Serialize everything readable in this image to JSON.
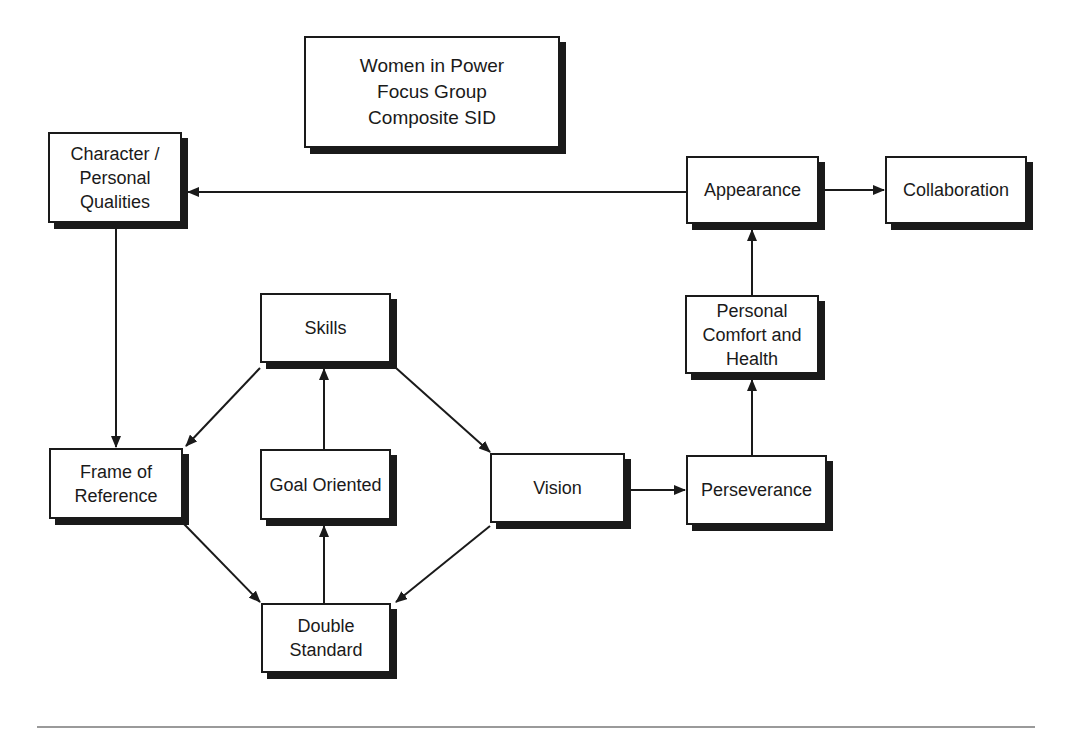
{
  "title": {
    "text": "Women in Power\nFocus Group\nComposite SID"
  },
  "nodes": {
    "character": {
      "label": "Character /\nPersonal\nQualities"
    },
    "appearance": {
      "label": "Appearance"
    },
    "collaboration": {
      "label": "Collaboration"
    },
    "comfort": {
      "label": "Personal\nComfort and\nHealth"
    },
    "skills": {
      "label": "Skills"
    },
    "frame": {
      "label": "Frame of\nReference"
    },
    "goal": {
      "label": "Goal Oriented"
    },
    "vision": {
      "label": "Vision"
    },
    "perseverance": {
      "label": "Perseverance"
    },
    "double": {
      "label": "Double\nStandard"
    }
  },
  "edges": [
    {
      "from": "Appearance",
      "to": "Character / Personal Qualities"
    },
    {
      "from": "Appearance",
      "to": "Collaboration"
    },
    {
      "from": "Character / Personal Qualities",
      "to": "Frame of Reference"
    },
    {
      "from": "Personal Comfort and Health",
      "to": "Appearance"
    },
    {
      "from": "Perseverance",
      "to": "Personal Comfort and Health"
    },
    {
      "from": "Skills",
      "to": "Frame of Reference"
    },
    {
      "from": "Skills",
      "to": "Vision"
    },
    {
      "from": "Goal Oriented",
      "to": "Skills"
    },
    {
      "from": "Frame of Reference",
      "to": "Double Standard"
    },
    {
      "from": "Double Standard",
      "to": "Goal Oriented"
    },
    {
      "from": "Vision",
      "to": "Double Standard"
    },
    {
      "from": "Vision",
      "to": "Perseverance"
    }
  ],
  "colors": {
    "stroke": "#1a1a1a",
    "rule": "#9a9a9a"
  }
}
